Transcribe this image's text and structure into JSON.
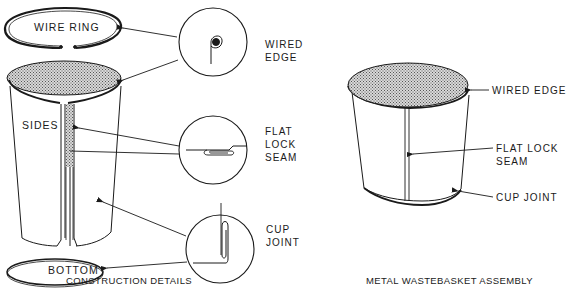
{
  "construction": {
    "caption": "CONSTRUCTION DETAILS",
    "parts": {
      "wire_ring": "WIRE RING",
      "sides": "SIDES",
      "bottom": "BOTTOM"
    },
    "details": [
      {
        "name": "wired-edge",
        "line1": "WIRED",
        "line2": "EDGE",
        "line3": ""
      },
      {
        "name": "flat-lock-seam",
        "line1": "FLAT",
        "line2": "LOCK",
        "line3": "SEAM"
      },
      {
        "name": "cup-joint",
        "line1": "CUP",
        "line2": "JOINT",
        "line3": ""
      }
    ]
  },
  "assembly": {
    "caption": "METAL WASTEBASKET ASSEMBLY",
    "labels": {
      "wired_edge": "WIRED EDGE",
      "flat_lock_line1": "FLAT LOCK",
      "flat_lock_line2": "SEAM",
      "cup_joint": "CUP JOINT"
    }
  },
  "colors": {
    "ink": "#1a1a1a",
    "background": "#ffffff",
    "hatch": "#555555"
  }
}
